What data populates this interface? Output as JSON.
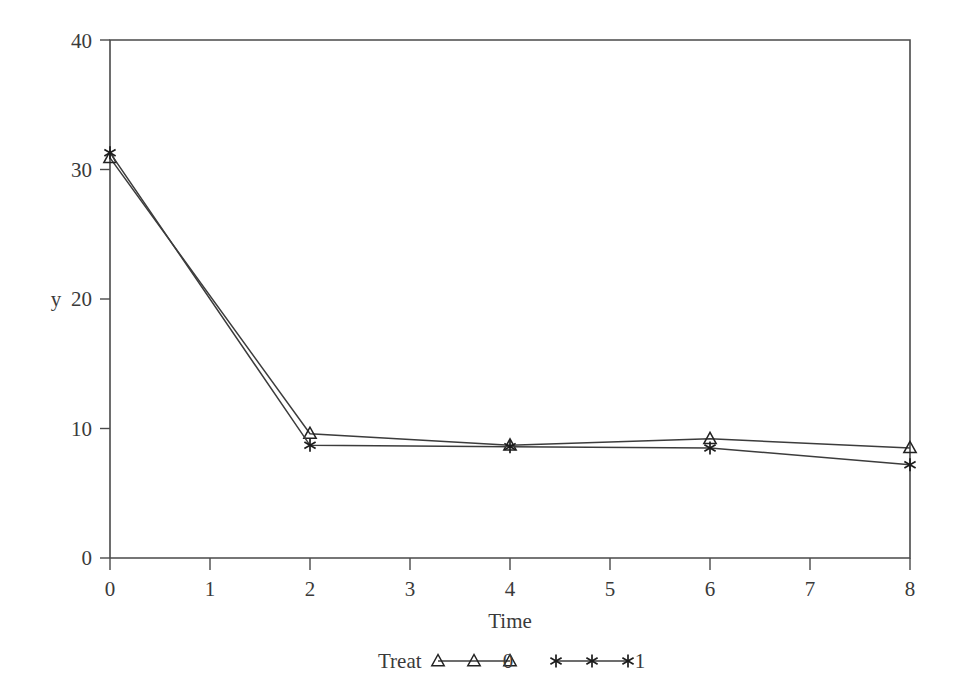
{
  "chart_data": {
    "type": "line",
    "title": "",
    "subtitle": "",
    "xlabel": "Time",
    "ylabel": "y",
    "xlim": [
      0,
      8
    ],
    "ylim": [
      0,
      40
    ],
    "xticks": [
      0,
      1,
      2,
      3,
      4,
      5,
      6,
      7,
      8
    ],
    "yticks": [
      0,
      10,
      20,
      30,
      40
    ],
    "xtick_labels": [
      "0",
      "1",
      "2",
      "3",
      "4",
      "5",
      "6",
      "7",
      "8"
    ],
    "ytick_labels": [
      "0",
      "10",
      "20",
      "30",
      "40"
    ],
    "grid": false,
    "legend_position": "bottom",
    "legend_title": "Treat",
    "x": [
      0,
      2,
      4,
      6,
      8
    ],
    "series": [
      {
        "name": "0",
        "marker": "open-triangle",
        "values": [
          30.9,
          9.6,
          8.7,
          9.2,
          8.5
        ]
      },
      {
        "name": "1",
        "marker": "asterisk-star",
        "values": [
          31.3,
          8.7,
          8.6,
          8.5,
          7.2
        ]
      }
    ],
    "colors": {
      "axis": "#4a4a4a",
      "line": "#3c3c3c",
      "marker": "#222222",
      "text": "#3a3a3a",
      "background": "#ffffff"
    }
  },
  "axes": {
    "y_axis_title": "y",
    "x_axis_title": "Time",
    "y_tick_0": "0",
    "y_tick_10": "10",
    "y_tick_20": "20",
    "y_tick_30": "30",
    "y_tick_40": "40",
    "x_tick_0": "0",
    "x_tick_1": "1",
    "x_tick_2": "2",
    "x_tick_3": "3",
    "x_tick_4": "4",
    "x_tick_5": "5",
    "x_tick_6": "6",
    "x_tick_7": "7",
    "x_tick_8": "8"
  },
  "legend": {
    "title": "Treat",
    "entry_0_label": "0",
    "entry_1_label": "1"
  }
}
